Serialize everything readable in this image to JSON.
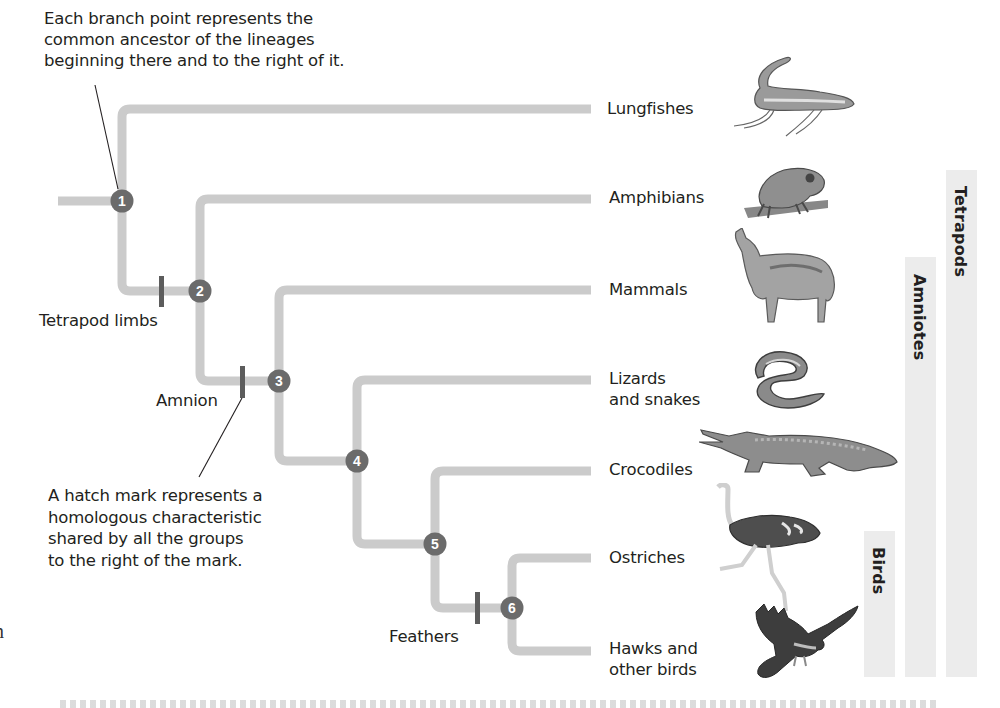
{
  "annotations": {
    "branch_point_note": [
      "Each branch point represents the",
      "common ancestor of the lineages",
      "beginning there and to the right of it."
    ],
    "hatch_mark_note": [
      "A hatch mark represents a",
      "homologous characteristic",
      "shared by all the groups",
      "to the right of the mark."
    ]
  },
  "traits": {
    "tetrapod_limbs": "Tetrapod limbs",
    "amnion": "Amnion",
    "feathers": "Feathers"
  },
  "nodes": [
    {
      "id": "1",
      "x": 122,
      "y": 201
    },
    {
      "id": "2",
      "x": 200,
      "y": 291
    },
    {
      "id": "3",
      "x": 279,
      "y": 381
    },
    {
      "id": "4",
      "x": 357,
      "y": 461
    },
    {
      "id": "5",
      "x": 435,
      "y": 544
    },
    {
      "id": "6",
      "x": 512,
      "y": 608
    }
  ],
  "taxa": {
    "lungfishes": "Lungfishes",
    "amphibians": "Amphibians",
    "mammals": "Mammals",
    "lizards_line1": "Lizards",
    "lizards_line2": "and snakes",
    "crocodiles": "Crocodiles",
    "ostriches": "Ostriches",
    "hawks_line1": "Hawks and",
    "hawks_line2": "other birds"
  },
  "clades": {
    "tetrapods": "Tetrapods",
    "amniotes": "Amniotes",
    "birds": "Birds"
  },
  "animals": {
    "lungfish": "lungfish-illustration",
    "frog": "frog-illustration",
    "wolf": "wolf-illustration",
    "snake": "snake-illustration",
    "crocodile": "crocodile-illustration",
    "ostrich": "ostrich-illustration",
    "hawk": "hawk-illustration"
  },
  "colors": {
    "branch": "#cbcbcb",
    "node": "#6b6b6b",
    "hatch": "#5c5c5c",
    "clade_bar": "#ececec",
    "text": "#231f20"
  }
}
